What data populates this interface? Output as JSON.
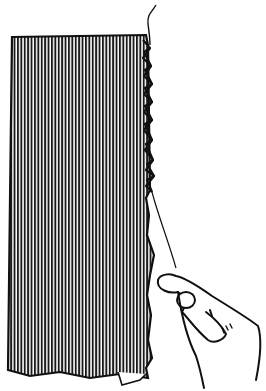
{
  "illustration": {
    "subject": "hand sewing a zigzag hand stitch along the raw edge of striped fabric",
    "colors": {
      "background": "#ffffff",
      "ink": "#111111",
      "fabric_stripe_light": "#d9d9d9"
    }
  }
}
